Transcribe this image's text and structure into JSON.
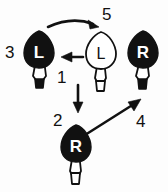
{
  "diagram": {
    "background_color": "#fdfdfd",
    "ink_color": "#111111",
    "nodes": [
      {
        "id": "bulb-left",
        "label": "L",
        "fill": "filled",
        "fill_color": "#111111",
        "letter_color": "#ffffff",
        "base_tip": "filled",
        "step_number": "3"
      },
      {
        "id": "bulb-center",
        "label": "L",
        "fill": "outline",
        "fill_color": "#ffffff",
        "letter_color": "#111111",
        "base_tip": "outline",
        "step_number": ""
      },
      {
        "id": "bulb-right",
        "label": "R",
        "fill": "filled",
        "fill_color": "#111111",
        "letter_color": "#ffffff",
        "base_tip": "filled",
        "step_number": "4"
      },
      {
        "id": "bulb-bottom",
        "label": "R",
        "fill": "filled",
        "fill_color": "#111111",
        "letter_color": "#ffffff",
        "base_tip": "outline",
        "step_number": "2"
      }
    ],
    "arrows": [
      {
        "id": "arrow-curved-top",
        "shape": "curved",
        "from": "bulb-left",
        "to": "bulb-center",
        "direction": "right",
        "step_number": "5"
      },
      {
        "id": "arrow-horizontal-left",
        "shape": "straight",
        "from": "bulb-center",
        "to": "bulb-left",
        "direction": "left",
        "step_number": "1"
      },
      {
        "id": "arrow-vertical-down",
        "shape": "straight",
        "from": "bulb-center",
        "to": "bulb-bottom",
        "direction": "down",
        "step_number": "2"
      },
      {
        "id": "arrow-diagonal-up-right",
        "shape": "straight",
        "from": "bulb-bottom",
        "to": "bulb-right",
        "direction": "up-right",
        "step_number": "4"
      }
    ],
    "labels": {
      "label_1": "1",
      "label_2": "2",
      "label_3": "3",
      "label_4": "4",
      "label_5": "5"
    }
  }
}
